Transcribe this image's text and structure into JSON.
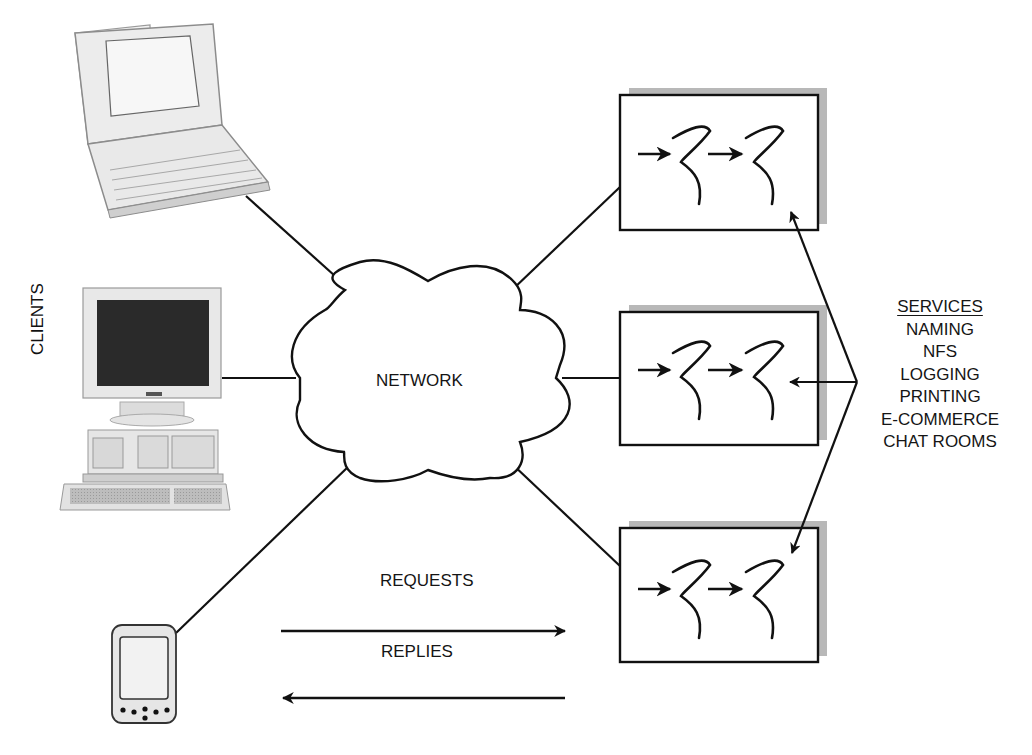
{
  "diagram": {
    "type": "client-server network diagram",
    "clients_label": "CLIENTS",
    "network_label": "NETWORK",
    "clients": [
      {
        "name": "laptop",
        "kind": "laptop computer"
      },
      {
        "name": "desktop",
        "kind": "desktop computer with CRT monitor and keyboard"
      },
      {
        "name": "pda",
        "kind": "handheld PDA"
      }
    ],
    "servers": [
      {
        "name": "server-top",
        "content": "two threads with arrows"
      },
      {
        "name": "server-middle",
        "content": "two threads with arrows"
      },
      {
        "name": "server-bottom",
        "content": "two threads with arrows"
      }
    ],
    "flows": {
      "requests_label": "REQUESTS",
      "replies_label": "REPLIES"
    },
    "services": {
      "heading": "SERVICES",
      "items": [
        "NAMING",
        "NFS",
        "LOGGING",
        "PRINTING",
        "E-COMMERCE",
        "CHAT ROOMS"
      ]
    },
    "colors": {
      "line": "#111111",
      "shadow": "#b4b4b4",
      "screen": "#2a2a2a",
      "device": "#e6e6e6"
    }
  }
}
